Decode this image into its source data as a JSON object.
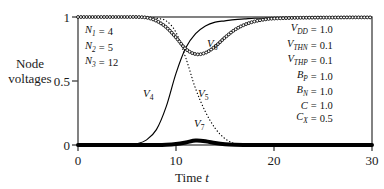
{
  "chart_data": {
    "type": "line",
    "title": "",
    "xlabel": "Time t",
    "ylabel": "Node voltages",
    "xlim": [
      0,
      30
    ],
    "ylim": [
      0,
      1
    ],
    "grid": false,
    "legend": "inline-curve-labels",
    "xticks": [
      "0",
      "10",
      "20",
      "30"
    ],
    "xtick_values": [
      0,
      10,
      20,
      30
    ],
    "yticks": [
      "0",
      "0.5",
      "1"
    ],
    "ytick_values": [
      0,
      0.5,
      1
    ],
    "x": [
      0,
      1,
      2,
      3,
      4,
      5,
      6,
      7,
      8,
      9,
      10,
      11,
      12,
      13,
      14,
      15,
      16,
      17,
      18,
      19,
      20,
      22,
      24,
      26,
      28,
      30
    ],
    "series": [
      {
        "name": "V4",
        "label": "V",
        "sub": "4",
        "style": "solid",
        "values": [
          0,
          0,
          0,
          0,
          0,
          0,
          0.01,
          0.04,
          0.12,
          0.3,
          0.56,
          0.76,
          0.87,
          0.93,
          0.96,
          0.97,
          0.98,
          0.985,
          0.99,
          0.99,
          0.993,
          0.995,
          0.996,
          0.997,
          0.998,
          0.998
        ]
      },
      {
        "name": "V5",
        "label": "V",
        "sub": "5",
        "style": "dotted",
        "values": [
          1,
          1,
          1,
          1,
          1,
          1,
          1,
          1,
          0.99,
          0.97,
          0.88,
          0.68,
          0.44,
          0.26,
          0.13,
          0.05,
          0.01,
          0,
          0,
          0,
          0,
          0,
          0,
          0,
          0,
          0
        ]
      },
      {
        "name": "V6",
        "label": "V",
        "sub": "6",
        "style": "circles",
        "values": [
          1,
          1,
          1,
          1,
          1,
          1,
          1,
          0.995,
          0.97,
          0.92,
          0.84,
          0.75,
          0.71,
          0.72,
          0.77,
          0.84,
          0.9,
          0.94,
          0.965,
          0.98,
          0.988,
          0.993,
          0.995,
          0.996,
          0.997,
          0.997
        ]
      },
      {
        "name": "V7",
        "label": "V",
        "sub": "7",
        "style": "thick",
        "values": [
          0,
          0,
          0,
          0,
          0,
          0,
          0,
          0,
          0,
          0.002,
          0.008,
          0.02,
          0.035,
          0.03,
          0.015,
          0.005,
          0.001,
          0,
          0,
          0,
          0,
          0,
          0,
          0,
          0,
          0
        ]
      }
    ],
    "annotations_left": [
      {
        "sym": "N",
        "sub": "1",
        "eq": "=",
        "val": "4"
      },
      {
        "sym": "N",
        "sub": "2",
        "eq": "=",
        "val": "5"
      },
      {
        "sym": "N",
        "sub": "3",
        "eq": "=",
        "val": "12"
      }
    ],
    "annotations_right": [
      {
        "sym": "V",
        "sub": "DD",
        "eq": "=",
        "val": "1.0"
      },
      {
        "sym": "V",
        "sub": "THN",
        "eq": "=",
        "val": "0.1"
      },
      {
        "sym": "V",
        "sub": "THP",
        "eq": "=",
        "val": "0.1"
      },
      {
        "sym": "B",
        "sub": "P",
        "eq": "=",
        "val": "1.0"
      },
      {
        "sym": "B",
        "sub": "N",
        "eq": "=",
        "val": "1.0"
      },
      {
        "sym": "C",
        "sub": "",
        "eq": "=",
        "val": "1.0"
      },
      {
        "sym": "C",
        "sub": "X",
        "eq": "=",
        "val": "0.5"
      }
    ],
    "curve_labels": [
      {
        "name": "V4",
        "label": "V",
        "sub": "4",
        "x_px": 143,
        "y_px": 88
      },
      {
        "name": "V5",
        "label": "V",
        "sub": "5",
        "x_px": 198,
        "y_px": 88
      },
      {
        "name": "V6",
        "label": "V",
        "sub": "6",
        "x_px": 207,
        "y_px": 38
      },
      {
        "name": "V7",
        "label": "V",
        "sub": "7",
        "x_px": 194,
        "y_px": 118
      }
    ],
    "colors": {
      "line": "#000000",
      "frame": "#4d4d4d",
      "text": "#111111",
      "background": "#ffffff"
    }
  },
  "axis": {
    "y_title_line1": "Node",
    "y_title_line2": "voltages",
    "x_title_main": "Time",
    "x_title_ital": "t"
  }
}
